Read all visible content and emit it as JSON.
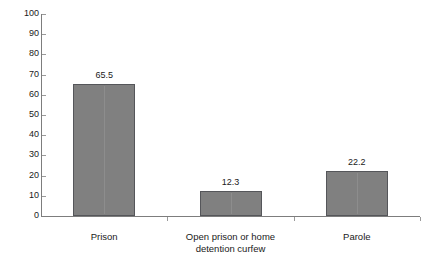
{
  "chart_data": {
    "type": "bar",
    "title": "",
    "subtitle": "",
    "xlabel": "",
    "ylabel": "",
    "categories": [
      "Prison",
      "Open prison or home detention curfew",
      "Parole"
    ],
    "category_lines": [
      [
        "Prison"
      ],
      [
        "Open prison or home",
        "detention curfew"
      ],
      [
        "Parole"
      ]
    ],
    "values": [
      65.5,
      12.3,
      22.2
    ],
    "value_labels": [
      "65.5",
      "12.3",
      "22.2"
    ],
    "ylim": [
      0,
      100
    ],
    "ytick_step": 10,
    "ytick_labels": [
      "0",
      "10",
      "20",
      "30",
      "40",
      "50",
      "60",
      "70",
      "80",
      "90",
      "100"
    ],
    "grid": false,
    "legend": null,
    "legend_position": "none",
    "bar_color": "#808080",
    "bar_edge_color": "#55565a",
    "axis_color": "#7d7d7d",
    "text_color": "#1a1a1a",
    "background_color": "#ffffff"
  }
}
